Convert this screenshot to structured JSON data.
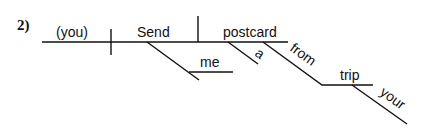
{
  "diagram": {
    "problem_number": "2)",
    "type": "sentence-diagram",
    "words": {
      "subject": "(you)",
      "verb": "Send",
      "indirect_object": "me",
      "direct_object": "postcard",
      "article": "a",
      "preposition": "from",
      "prep_object": "trip",
      "possessive": "your"
    }
  }
}
